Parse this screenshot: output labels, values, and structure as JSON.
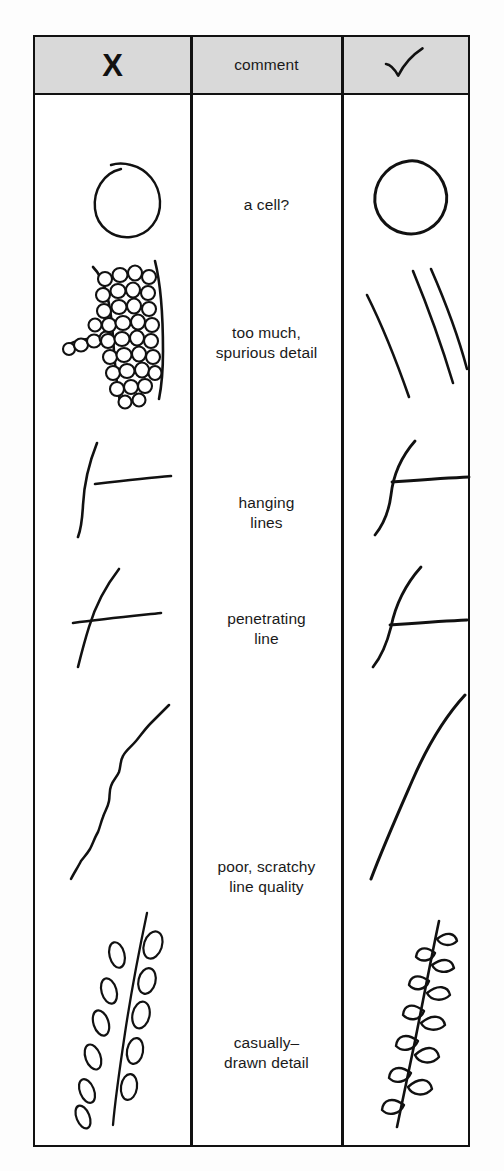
{
  "figure": {
    "type": "comparison-table",
    "columns": [
      {
        "key": "bad",
        "header_label": "X",
        "header_icon": "x-mark-icon"
      },
      {
        "key": "comment",
        "header_label": "comment",
        "header_icon": null
      },
      {
        "key": "good",
        "header_label": "✓",
        "header_icon": "check-mark-icon"
      }
    ],
    "rows": [
      {
        "comment": "a cell?",
        "bad_drawing": "open-ended-circle-with-overshoot",
        "good_drawing": "closed-clean-circle"
      },
      {
        "comment_line1": "too much,",
        "comment_line2": "spurious detail",
        "bad_drawing": "band-filled-with-many-small-cells",
        "good_drawing": "three-simple-curved-lines"
      },
      {
        "comment_line1": "hanging",
        "comment_line2": "lines",
        "bad_drawing": "vertical-curve-with-detached-horizontal-line",
        "good_drawing": "vertical-curve-with-joined-horizontal-line"
      },
      {
        "comment_line1": "penetrating",
        "comment_line2": "line",
        "bad_drawing": "horizontal-line-crossing-through-curve",
        "good_drawing": "horizontal-line-stopping-at-curve"
      },
      {
        "comment_line1": "poor, scratchy",
        "comment_line2": "line quality",
        "bad_drawing": "wobbly-scratchy-s-curve",
        "good_drawing": "smooth-confident-s-curve"
      },
      {
        "comment_line1": "casually–",
        "comment_line2": "drawn detail",
        "bad_drawing": "stem-with-detached-scattered-loose-leaves",
        "good_drawing": "stem-with-attached-neat-leaves"
      }
    ],
    "colors": {
      "ink": "#111111",
      "header_background": "#d9d9d9",
      "cell_background": "#ffffff",
      "page_background": "#fdfdfd"
    }
  }
}
